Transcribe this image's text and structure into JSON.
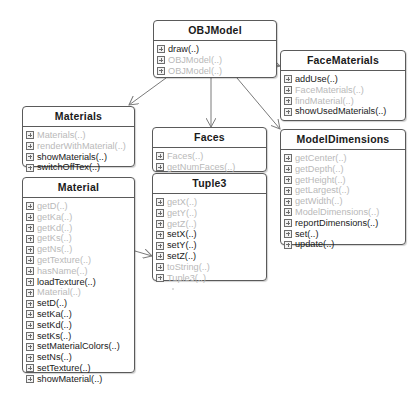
{
  "diagram": {
    "type": "uml-class-diagram",
    "classes": {
      "objmodel": {
        "name": "OBJModel",
        "methods": [
          {
            "label": "draw(..)",
            "muted": false
          },
          {
            "label": "OBJModel(..)",
            "muted": true
          },
          {
            "label": "OBJModel(..)",
            "muted": true
          }
        ]
      },
      "facematerials": {
        "name": "FaceMaterials",
        "methods": [
          {
            "label": "addUse(..)",
            "muted": false
          },
          {
            "label": "FaceMaterials(..)",
            "muted": true
          },
          {
            "label": "findMaterial(..)",
            "muted": true
          },
          {
            "label": "showUsedMaterials(..)",
            "muted": false
          }
        ]
      },
      "materials": {
        "name": "Materials",
        "methods": [
          {
            "label": "Materials(..)",
            "muted": true
          },
          {
            "label": "renderWithMaterial(..)",
            "muted": true
          },
          {
            "label": "showMaterials(..)",
            "muted": false
          },
          {
            "label": "switchOffTex(..)",
            "muted": false
          }
        ]
      },
      "faces": {
        "name": "Faces",
        "methods": [
          {
            "label": "Faces(..)",
            "muted": true
          },
          {
            "label": "getNumFaces(..)",
            "muted": true
          },
          {
            "label": "renderFace(..)",
            "muted": false
          }
        ]
      },
      "modeldimensions": {
        "name": "ModelDimensions",
        "methods": [
          {
            "label": "getCenter(..)",
            "muted": true
          },
          {
            "label": "getDepth(..)",
            "muted": true
          },
          {
            "label": "getHeight(..)",
            "muted": true
          },
          {
            "label": "getLargest(..)",
            "muted": true
          },
          {
            "label": "getWidth(..)",
            "muted": true
          },
          {
            "label": "ModelDimensions(..)",
            "muted": true
          },
          {
            "label": "reportDimensions(..)",
            "muted": false
          },
          {
            "label": "set(..)",
            "muted": false
          },
          {
            "label": "update(..)",
            "muted": false
          }
        ]
      },
      "material": {
        "name": "Material",
        "methods": [
          {
            "label": "getD(..)",
            "muted": true
          },
          {
            "label": "getKa(..)",
            "muted": true
          },
          {
            "label": "getKd(..)",
            "muted": true
          },
          {
            "label": "getKs(..)",
            "muted": true
          },
          {
            "label": "getNs(..)",
            "muted": true
          },
          {
            "label": "getTexture(..)",
            "muted": true
          },
          {
            "label": "hasName(..)",
            "muted": true
          },
          {
            "label": "loadTexture(..)",
            "muted": false
          },
          {
            "label": "Material(..)",
            "muted": true
          },
          {
            "label": "setD(..)",
            "muted": false
          },
          {
            "label": "setKa(..)",
            "muted": false
          },
          {
            "label": "setKd(..)",
            "muted": false
          },
          {
            "label": "setKs(..)",
            "muted": false
          },
          {
            "label": "setMaterialColors(..)",
            "muted": false
          },
          {
            "label": "setNs(..)",
            "muted": false
          },
          {
            "label": "setTexture(..)",
            "muted": false
          },
          {
            "label": "showMaterial(..)",
            "muted": false
          }
        ]
      },
      "tuple3": {
        "name": "Tuple3",
        "methods": [
          {
            "label": "getX(..)",
            "muted": true
          },
          {
            "label": "getY(..)",
            "muted": true
          },
          {
            "label": "getZ(..)",
            "muted": true
          },
          {
            "label": "setX(..)",
            "muted": false
          },
          {
            "label": "setY(..)",
            "muted": false
          },
          {
            "label": "setZ(..)",
            "muted": false
          },
          {
            "label": "toString(..)",
            "muted": true
          },
          {
            "label": "Tuple3(..)",
            "muted": true
          }
        ]
      }
    },
    "associations": [
      {
        "from": "OBJModel",
        "to": "FaceMaterials"
      },
      {
        "from": "OBJModel",
        "to": "Materials"
      },
      {
        "from": "OBJModel",
        "to": "Faces"
      },
      {
        "from": "OBJModel",
        "to": "ModelDimensions"
      },
      {
        "from": "Material",
        "to": "Tuple3"
      }
    ],
    "colors": {
      "border": "#5a5a5a",
      "text": "#1a1a1a",
      "muted_text": "#b9b9b9",
      "link": "#7a7a7a"
    }
  }
}
